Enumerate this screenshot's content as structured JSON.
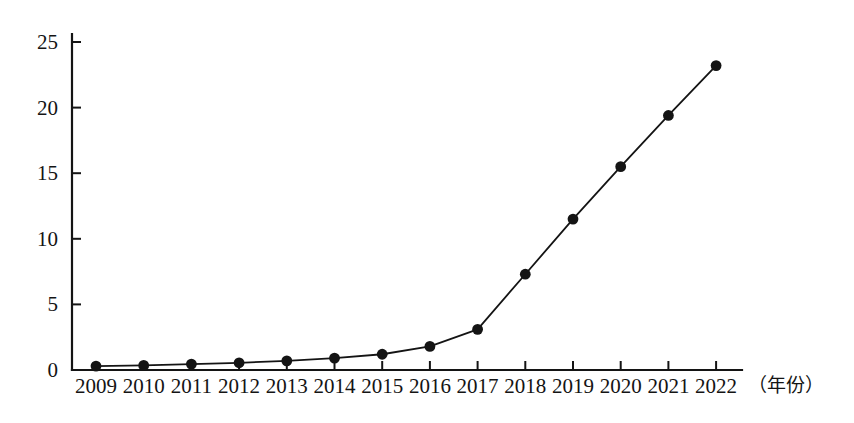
{
  "chart_data": {
    "type": "line",
    "title": "",
    "subtitle": "",
    "xlabel": "（年份）",
    "ylabel": "",
    "categories": [
      "2009",
      "2010",
      "2011",
      "2012",
      "2013",
      "2014",
      "2015",
      "2016",
      "2017",
      "2018",
      "2019",
      "2020",
      "2021",
      "2022"
    ],
    "values": [
      0.3,
      0.35,
      0.45,
      0.55,
      0.7,
      0.9,
      1.2,
      1.8,
      3.1,
      7.3,
      11.5,
      15.5,
      19.4,
      23.2
    ],
    "series": [
      {
        "name": "",
        "values": [
          0.3,
          0.35,
          0.45,
          0.55,
          0.7,
          0.9,
          1.2,
          1.8,
          3.1,
          7.3,
          11.5,
          15.5,
          19.4,
          23.2
        ]
      }
    ],
    "x": [
      "2009",
      "2010",
      "2011",
      "2012",
      "2013",
      "2014",
      "2015",
      "2016",
      "2017",
      "2018",
      "2019",
      "2020",
      "2021",
      "2022"
    ],
    "ylim": [
      0,
      25
    ],
    "yticks": [
      "0",
      "5",
      "10",
      "15",
      "20",
      "25"
    ],
    "ytick_values": [
      0,
      5,
      10,
      15,
      20,
      25
    ],
    "xticks": [
      "2009",
      "2010",
      "2011",
      "2012",
      "2013",
      "2014",
      "2015",
      "2016",
      "2017",
      "2018",
      "2019",
      "2020",
      "2021",
      "2022"
    ],
    "grid": false,
    "legend": null,
    "legend_position": "none",
    "annotations": [],
    "marker": "filled-circle",
    "line_color": "#141414",
    "marker_color": "#141414",
    "axis_color": "#141414",
    "background": "#ffffff"
  },
  "axis": {
    "x_unit_label": "（年份）",
    "y_unit_label": ""
  }
}
